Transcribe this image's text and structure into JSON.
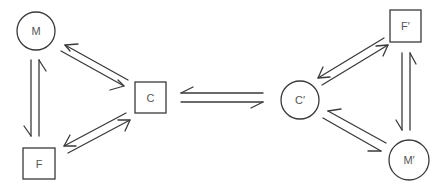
{
  "diagram": {
    "type": "reversible-reaction-network",
    "nodes": [
      {
        "id": "M",
        "label": "M",
        "shape": "circle",
        "cx": 36,
        "cy": 31,
        "r": 19
      },
      {
        "id": "F",
        "label": "F",
        "shape": "square",
        "x": 23,
        "y": 148,
        "w": 32,
        "h": 31
      },
      {
        "id": "C",
        "label": "C",
        "shape": "square",
        "x": 135,
        "y": 82,
        "w": 31,
        "h": 31
      },
      {
        "id": "C2",
        "label": "C′",
        "shape": "circle",
        "cx": 300,
        "cy": 100,
        "r": 19
      },
      {
        "id": "F2",
        "label": "F′",
        "shape": "square",
        "x": 390,
        "y": 10,
        "w": 31,
        "h": 32
      },
      {
        "id": "M2",
        "label": "M′",
        "shape": "circle",
        "cx": 409,
        "cy": 160,
        "r": 20
      }
    ],
    "edges": [
      {
        "from": "M",
        "to": "C",
        "type": "equilibrium"
      },
      {
        "from": "M",
        "to": "F",
        "type": "equilibrium"
      },
      {
        "from": "F",
        "to": "C",
        "type": "equilibrium"
      },
      {
        "from": "C",
        "to": "C2",
        "type": "equilibrium"
      },
      {
        "from": "C2",
        "to": "F2",
        "type": "equilibrium"
      },
      {
        "from": "F2",
        "to": "M2",
        "type": "equilibrium"
      },
      {
        "from": "C2",
        "to": "M2",
        "type": "equilibrium"
      }
    ],
    "colors": {
      "stroke": "#3a3a3a",
      "text": "#555555",
      "background": "#ffffff"
    }
  }
}
